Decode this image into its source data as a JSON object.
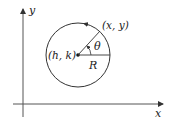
{
  "diagram": {
    "axes": {
      "x_label": "x",
      "y_label": "y"
    },
    "circle": {
      "center_label": "(h, k)",
      "point_label": "(x, y)",
      "angle_label": "θ",
      "radius_label": "R",
      "direction": "counterclockwise"
    },
    "colors": {
      "stroke": "#333333",
      "background": "#ffffff"
    }
  }
}
